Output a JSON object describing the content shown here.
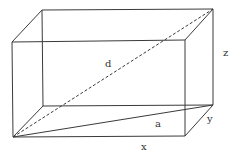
{
  "diagram": {
    "type": "rectangular-box-diagonals",
    "colors": {
      "line": "#3a3a3a",
      "label": "#333333",
      "background": "#ffffff"
    },
    "vertices": {
      "front_top_left": [
        12,
        42
      ],
      "front_top_right": [
        185,
        40
      ],
      "front_bottom_left": [
        13,
        137
      ],
      "front_bottom_right": [
        185,
        136
      ],
      "back_top_left": [
        42,
        10
      ],
      "back_top_right": [
        213,
        9
      ],
      "back_bottom_left": [
        43,
        106
      ],
      "back_bottom_right": [
        213,
        105
      ]
    },
    "labels": {
      "d": {
        "text": "d",
        "pos": [
          108,
          67
        ]
      },
      "a": {
        "text": "a",
        "pos": [
          157,
          127
        ]
      },
      "x": {
        "text": "x",
        "pos": [
          144,
          150
        ]
      },
      "y": {
        "text": "y",
        "pos": [
          208,
          122
        ]
      },
      "z": {
        "text": "z",
        "pos": [
          224,
          55
        ]
      }
    },
    "segments": {
      "space_diagonal": {
        "label": "d",
        "style": "dashed",
        "from": "front_bottom_left",
        "to": "back_top_right"
      },
      "base_diagonal": {
        "label": "a",
        "style": "solid",
        "from": "front_bottom_left",
        "to": "back_bottom_right"
      }
    }
  }
}
